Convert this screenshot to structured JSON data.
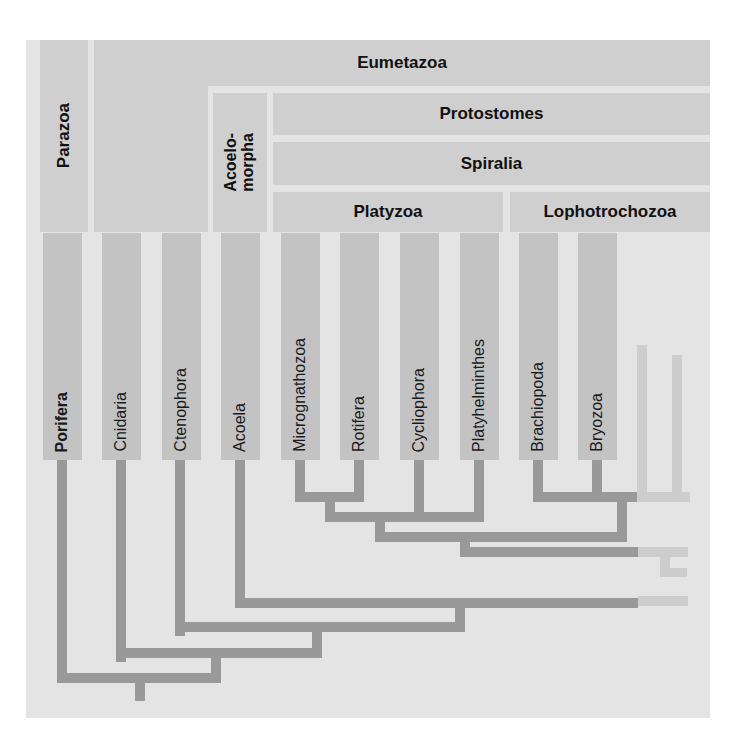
{
  "diagram": {
    "type": "phylogenetic-tree",
    "background_color": "#e4e4e4",
    "box_color": "#cfcfcf",
    "taxon_bar_color": "#c3c3c3",
    "branch_color": "#999999",
    "faded_branch_color": "#c9c9c9"
  },
  "clades": {
    "parazoa": "Parazoa",
    "eumetazoa": "Eumetazoa",
    "acoelomorpha": "Acoelo-\nmorpha",
    "protostomes": "Protostomes",
    "spiralia": "Spiralia",
    "platyzoa": "Platyzoa",
    "lophotrochozoa": "Lophotrochozoa"
  },
  "taxa": [
    {
      "label": "Porifera",
      "bold": true
    },
    {
      "label": "Cnidaria",
      "bold": false
    },
    {
      "label": "Ctenophora",
      "bold": false
    },
    {
      "label": "Acoela",
      "bold": false
    },
    {
      "label": "Micrognathozoa",
      "bold": false
    },
    {
      "label": "Rotifera",
      "bold": false
    },
    {
      "label": "Cycliophora",
      "bold": false
    },
    {
      "label": "Platyhelminthes",
      "bold": false
    },
    {
      "label": "Brachiopoda",
      "bold": false
    },
    {
      "label": "Bryozoa",
      "bold": false
    }
  ],
  "taxon_x": [
    43,
    102,
    162,
    221,
    281,
    340,
    400,
    460,
    519,
    578
  ],
  "taxon_width": 39
}
